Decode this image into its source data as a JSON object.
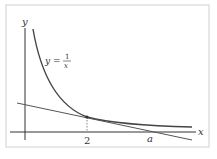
{
  "figure": {
    "axis_x_label": "x",
    "axis_y_label": "y",
    "curve_label_lhs": "y =",
    "curve_label_num": "1",
    "curve_label_den": "x",
    "tick_2": "2",
    "tick_a": "a"
  },
  "colors": {
    "curve": "#444444",
    "tangent": "#555555",
    "frame": "#cccccc"
  }
}
